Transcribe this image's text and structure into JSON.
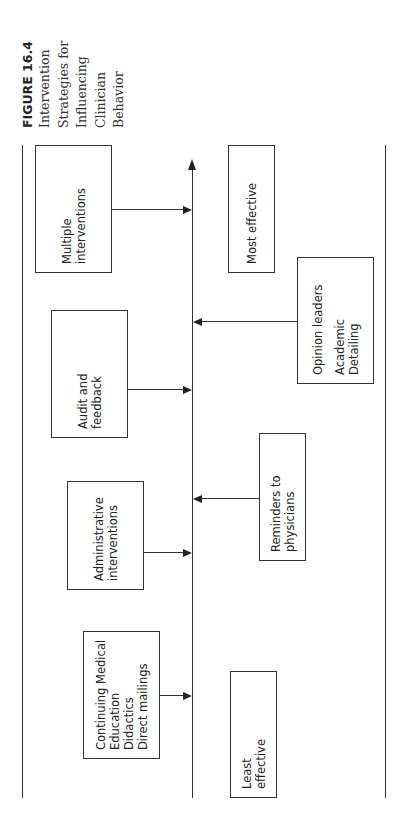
{
  "figure": {
    "label": "FIGURE 16.4",
    "caption_lines": [
      "Intervention",
      "Strategies for",
      "Influencing",
      "Clinician",
      "Behavior"
    ]
  },
  "diagram": {
    "orientation": "rotated 90 degrees counter-clockwise",
    "axis": {
      "direction": "least effective to most effective",
      "low_label_lines": [
        "Least",
        "effective"
      ],
      "high_label_lines": [
        "Most effective"
      ]
    },
    "interventions_above_axis": [
      {
        "lines": [
          "Continuing Medical",
          "Education",
          "Didactics",
          "Direct mailings"
        ]
      },
      {
        "lines": [
          "Administrative",
          "interventions"
        ]
      },
      {
        "lines": [
          "Audit and",
          "feedback"
        ]
      },
      {
        "lines": [
          "Multiple",
          "interventions"
        ]
      }
    ],
    "interventions_below_axis": [
      {
        "lines": [
          "Reminders to",
          "physicians"
        ]
      },
      {
        "lines": [
          "Opinion leaders"
        ],
        "extra_lines": [
          "Academic",
          "Detailing"
        ]
      }
    ]
  }
}
